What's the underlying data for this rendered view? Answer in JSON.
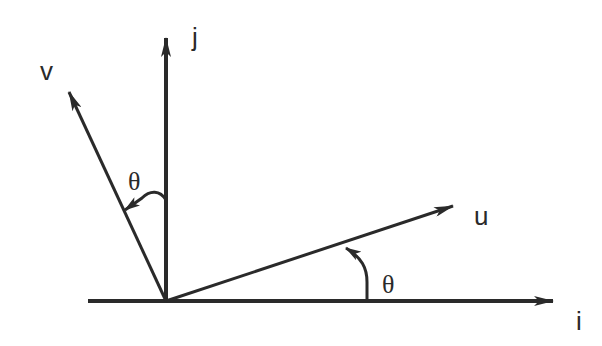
{
  "diagram": {
    "origin": [
      166,
      301
    ],
    "colors": {
      "stroke": "#2a2a2a",
      "background": "#ffffff"
    },
    "axes": [
      {
        "name": "i",
        "label": "i",
        "from": [
          88,
          301
        ],
        "to": [
          553,
          301
        ],
        "label_pos": [
          576,
          330
        ]
      },
      {
        "name": "j",
        "label": "j",
        "from": [
          166,
          301
        ],
        "to": [
          166,
          38
        ],
        "label_pos": [
          192,
          46
        ]
      }
    ],
    "vectors": [
      {
        "name": "u",
        "label": "u",
        "from": [
          166,
          301
        ],
        "to": [
          453,
          206
        ],
        "label_pos": [
          474,
          225
        ]
      },
      {
        "name": "v",
        "label": "v",
        "from": [
          166,
          301
        ],
        "to": [
          69,
          92
        ],
        "label_pos": [
          40,
          80
        ]
      }
    ],
    "angles": [
      {
        "name": "theta-lower",
        "label": "θ",
        "between": [
          "i",
          "u"
        ],
        "label_pos": [
          382,
          293
        ]
      },
      {
        "name": "theta-upper",
        "label": "θ",
        "between": [
          "j",
          "v"
        ],
        "label_pos": [
          128,
          190
        ]
      }
    ]
  }
}
